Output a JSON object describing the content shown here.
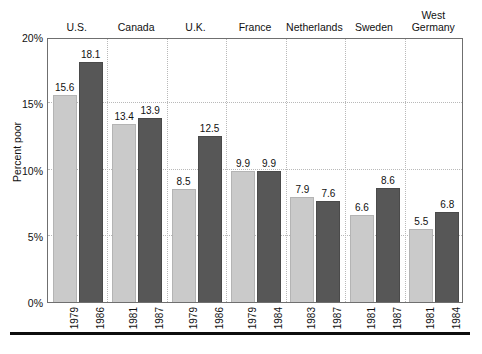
{
  "chart_data": {
    "type": "bar",
    "title": "",
    "xlabel": "",
    "ylabel": "Percent poor",
    "ylim": [
      0,
      20
    ],
    "y_tick_labels": [
      "0%",
      "5%",
      "10%",
      "15%",
      "20%"
    ],
    "y_tick_values": [
      0,
      5,
      10,
      15,
      20
    ],
    "grid": "dotted horizontal gridlines at 5%, 10%, 15%; dotted vertical separators between country groups",
    "legend": "none (light gray bar = earlier year, dark gray bar = later year; year printed under each bar)",
    "legend_position": "none",
    "categories": [
      "U.S.",
      "Canada",
      "U.K.",
      "France",
      "Netherlands",
      "Sweden",
      "West\nGermany"
    ],
    "series": [
      {
        "name": "Earlier year",
        "color": "#cacaca",
        "values": [
          15.6,
          13.4,
          8.5,
          9.9,
          7.9,
          6.6,
          5.5
        ],
        "years": [
          "1979",
          "1981",
          "1979",
          "1979",
          "1983",
          "1981",
          "1981"
        ]
      },
      {
        "name": "Later year",
        "color": "#575757",
        "values": [
          18.1,
          13.9,
          12.5,
          9.9,
          7.6,
          8.6,
          6.8
        ],
        "years": [
          "1986",
          "1987",
          "1986",
          "1984",
          "1987",
          "1987",
          "1984"
        ]
      }
    ],
    "groups": [
      {
        "label": "U.S.",
        "bars": [
          {
            "year": "1979",
            "value": 15.6,
            "value_label": "15.6",
            "shade": "light"
          },
          {
            "year": "1986",
            "value": 18.1,
            "value_label": "18.1",
            "shade": "dark"
          }
        ]
      },
      {
        "label": "Canada",
        "bars": [
          {
            "year": "1981",
            "value": 13.4,
            "value_label": "13.4",
            "shade": "light"
          },
          {
            "year": "1987",
            "value": 13.9,
            "value_label": "13.9",
            "shade": "dark"
          }
        ]
      },
      {
        "label": "U.K.",
        "bars": [
          {
            "year": "1979",
            "value": 8.5,
            "value_label": "8.5",
            "shade": "light"
          },
          {
            "year": "1986",
            "value": 12.5,
            "value_label": "12.5",
            "shade": "dark"
          }
        ]
      },
      {
        "label": "France",
        "bars": [
          {
            "year": "1979",
            "value": 9.9,
            "value_label": "9.9",
            "shade": "light"
          },
          {
            "year": "1984",
            "value": 9.9,
            "value_label": "9.9",
            "shade": "dark"
          }
        ]
      },
      {
        "label": "Netherlands",
        "bars": [
          {
            "year": "1983",
            "value": 7.9,
            "value_label": "7.9",
            "shade": "light"
          },
          {
            "year": "1987",
            "value": 7.6,
            "value_label": "7.6",
            "shade": "dark"
          }
        ]
      },
      {
        "label": "Sweden",
        "bars": [
          {
            "year": "1981",
            "value": 6.6,
            "value_label": "6.6",
            "shade": "light"
          },
          {
            "year": "1987",
            "value": 8.6,
            "value_label": "8.6",
            "shade": "dark"
          }
        ]
      },
      {
        "label": "West\nGermany",
        "bars": [
          {
            "year": "1981",
            "value": 5.5,
            "value_label": "5.5",
            "shade": "light"
          },
          {
            "year": "1984",
            "value": 6.8,
            "value_label": "6.8",
            "shade": "dark"
          }
        ]
      }
    ],
    "colors": {
      "light_bar": "#cacaca",
      "dark_bar": "#575757",
      "gridline": "#b9b9b9",
      "axis": "#6f6f6f",
      "rule": "#0d0d0d",
      "text": "#111111",
      "background": "#ffffff"
    }
  }
}
